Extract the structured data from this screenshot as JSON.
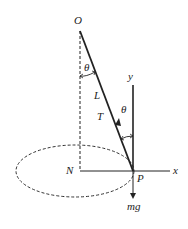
{
  "diagram": {
    "labels": {
      "pivot": "O",
      "center": "N",
      "bob": "P",
      "length": "L",
      "tension": "T",
      "angle_top": "θ",
      "angle_bob": "θ",
      "x_axis": "x",
      "y_axis": "y",
      "weight": "mg"
    },
    "colors": {
      "line": "#222222",
      "background": "#ffffff"
    }
  }
}
